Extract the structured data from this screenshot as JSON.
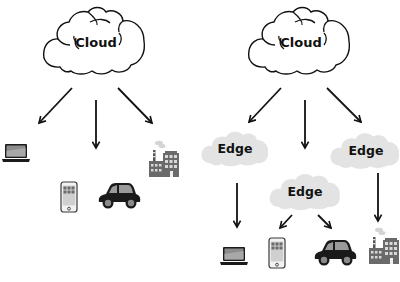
{
  "diagram": {
    "left_panel": {
      "title": "Cloud computing model",
      "cloud": {
        "label": "Cloud"
      },
      "devices": [
        {
          "name": "laptop",
          "icon": "laptop-icon"
        },
        {
          "name": "phone",
          "icon": "smartphone-icon"
        },
        {
          "name": "car",
          "icon": "car-icon"
        },
        {
          "name": "factory",
          "icon": "factory-icon"
        }
      ]
    },
    "right_panel": {
      "title": "Edge computing model",
      "cloud": {
        "label": "Cloud"
      },
      "edges": [
        {
          "label": "Edge",
          "serves": [
            "laptop"
          ]
        },
        {
          "label": "Edge",
          "serves": [
            "phone",
            "car"
          ]
        },
        {
          "label": "Edge",
          "serves": [
            "factory"
          ]
        }
      ],
      "devices": [
        {
          "name": "laptop",
          "icon": "laptop-icon"
        },
        {
          "name": "phone",
          "icon": "smartphone-icon"
        },
        {
          "name": "car",
          "icon": "car-icon"
        },
        {
          "name": "factory",
          "icon": "factory-icon"
        }
      ]
    },
    "colors": {
      "outline": "#111111",
      "edge_cloud_fill": "#e3e3e3",
      "icon_dark": "#1a1a1a",
      "icon_gray": "#7a7a7a",
      "background": "#ffffff"
    }
  }
}
